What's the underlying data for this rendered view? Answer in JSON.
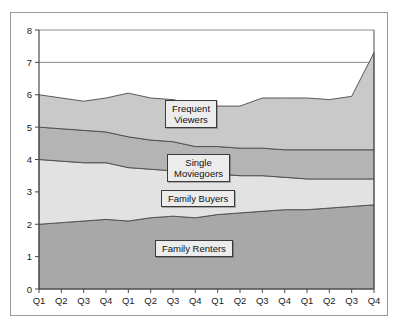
{
  "chart_data": {
    "type": "area",
    "stacked": true,
    "title": "",
    "xlabel": "",
    "ylabel": "",
    "ylim": [
      0,
      8
    ],
    "yticks": [
      0,
      1,
      2,
      3,
      4,
      5,
      6,
      7,
      8
    ],
    "grid": false,
    "legend_position": "inside-labels",
    "categories": [
      "Q1",
      "Q2",
      "Q3",
      "Q4",
      "Q1",
      "Q2",
      "Q3",
      "Q4",
      "Q1",
      "Q2",
      "Q3",
      "Q4",
      "Q1",
      "Q2",
      "Q3",
      "Q4"
    ],
    "series": [
      {
        "name": "Family Renters",
        "color": "#a8a8a8",
        "values": [
          2.0,
          2.05,
          2.1,
          2.15,
          2.1,
          2.2,
          2.25,
          2.2,
          2.3,
          2.35,
          2.4,
          2.45,
          2.45,
          2.5,
          2.55,
          2.6
        ]
      },
      {
        "name": "Family Buyers",
        "color": "#e2e2e2",
        "values": [
          2.0,
          1.9,
          1.8,
          1.75,
          1.65,
          1.5,
          1.4,
          1.35,
          1.25,
          1.15,
          1.1,
          1.0,
          0.95,
          0.9,
          0.85,
          0.8
        ]
      },
      {
        "name": "Single Moviegoers",
        "color": "#b4b4b4",
        "values": [
          1.0,
          1.0,
          1.0,
          0.95,
          0.95,
          0.9,
          0.9,
          0.85,
          0.85,
          0.85,
          0.85,
          0.85,
          0.9,
          0.9,
          0.9,
          0.9
        ]
      },
      {
        "name": "Frequent Viewers",
        "color": "#c9c9c9",
        "values": [
          1.0,
          0.95,
          0.9,
          1.05,
          1.35,
          1.3,
          1.3,
          1.3,
          1.25,
          1.3,
          1.55,
          1.6,
          1.6,
          1.55,
          1.65,
          3.0
        ]
      }
    ],
    "totals": [
      6.0,
      5.9,
      5.8,
      5.9,
      6.05,
      5.9,
      5.85,
      5.7,
      5.65,
      5.65,
      5.9,
      5.9,
      5.9,
      5.85,
      5.95,
      7.3
    ],
    "labels": [
      {
        "name": "Frequent Viewers",
        "lines": [
          "Frequent",
          "Viewers"
        ]
      },
      {
        "name": "Single Moviegoers",
        "lines": [
          "Single",
          "Moviegoers"
        ]
      },
      {
        "name": "Family Buyers",
        "lines": [
          "Family Buyers"
        ]
      },
      {
        "name": "Family Renters",
        "lines": [
          "Family Renters"
        ]
      }
    ]
  },
  "legend": {
    "frequent_viewers_line1": "Frequent",
    "frequent_viewers_line2": "Viewers",
    "single_moviegoers_line1": "Single",
    "single_moviegoers_line2": "Moviegoers",
    "family_buyers": "Family Buyers",
    "family_renters": "Family Renters"
  }
}
